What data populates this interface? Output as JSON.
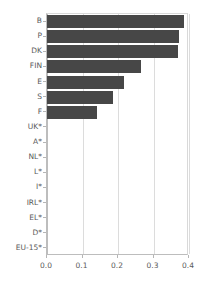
{
  "chart_data": {
    "type": "bar",
    "orientation": "horizontal",
    "title": "",
    "subtitle": "",
    "xlabel": "",
    "ylabel": "",
    "xlim": [
      0.0,
      0.4
    ],
    "ylim": null,
    "grid": true,
    "legend": null,
    "legend_position": "none",
    "bar_color": "#474747",
    "grid_color": "#dcdcdc",
    "axis_color": "#bdbdbd",
    "text_color": "#5a5a5a",
    "categories": [
      "B",
      "P",
      "DK",
      "FIN",
      "E",
      "S",
      "F",
      "UK*",
      "A*",
      "NL*",
      "L*",
      "I*",
      "IRL*",
      "EL*",
      "D*",
      "EU-15*"
    ],
    "values": [
      0.385,
      0.372,
      0.368,
      0.265,
      0.218,
      0.187,
      0.142,
      0.0,
      0.0,
      0.0,
      0.0,
      0.0,
      0.0,
      0.0,
      0.0,
      0.0
    ],
    "xticks": [
      0.0,
      0.1,
      0.2,
      0.3,
      0.4
    ],
    "xticklabels": [
      "0.0",
      "0.1",
      "0.2",
      "0.3",
      "0.4"
    ]
  }
}
